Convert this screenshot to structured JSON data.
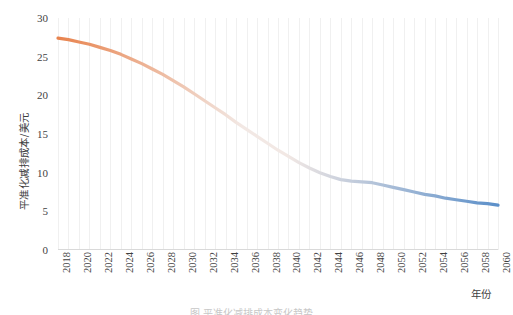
{
  "chart_data": {
    "type": "line",
    "title": "",
    "xlabel": "年份",
    "ylabel": "平准化减排成本/美元",
    "xlim": [
      2018,
      2060
    ],
    "ylim": [
      0,
      30
    ],
    "yticks": [
      0,
      5,
      10,
      15,
      20,
      25,
      30
    ],
    "xticks": [
      2018,
      2020,
      2022,
      2024,
      2026,
      2028,
      2030,
      2032,
      2034,
      2036,
      2038,
      2040,
      2042,
      2044,
      2046,
      2048,
      2050,
      2052,
      2054,
      2056,
      2058,
      2060
    ],
    "grid": "vertical-only",
    "legend": "none",
    "series": [
      {
        "name": "平准化减排成本",
        "gradient_start_color": "#E8834E",
        "gradient_mid_color": "#F2E8E4",
        "gradient_end_color": "#5B8FC9",
        "x": [
          2018,
          2019,
          2020,
          2021,
          2022,
          2023,
          2024,
          2025,
          2026,
          2027,
          2028,
          2029,
          2030,
          2031,
          2032,
          2033,
          2034,
          2035,
          2036,
          2037,
          2038,
          2039,
          2040,
          2041,
          2042,
          2043,
          2044,
          2045,
          2046,
          2047,
          2048,
          2049,
          2050,
          2051,
          2052,
          2053,
          2054,
          2055,
          2056,
          2057,
          2058,
          2059,
          2060
        ],
        "values": [
          27.4,
          27.2,
          26.9,
          26.6,
          26.2,
          25.8,
          25.3,
          24.7,
          24.1,
          23.4,
          22.7,
          21.9,
          21.1,
          20.2,
          19.3,
          18.4,
          17.5,
          16.5,
          15.6,
          14.7,
          13.8,
          12.9,
          12.1,
          11.3,
          10.6,
          10.0,
          9.5,
          9.1,
          8.9,
          8.8,
          8.7,
          8.4,
          8.1,
          7.8,
          7.5,
          7.2,
          7.0,
          6.7,
          6.5,
          6.3,
          6.1,
          6.0,
          5.8
        ]
      }
    ]
  },
  "axes": {
    "y_title": "平准化减排成本/美元",
    "x_title": "年份",
    "y_tick_labels": [
      "0",
      "5",
      "10",
      "15",
      "20",
      "25",
      "30"
    ],
    "x_tick_labels": [
      "2018",
      "2020",
      "2022",
      "2024",
      "2026",
      "2028",
      "2030",
      "2032",
      "2034",
      "2036",
      "2038",
      "2040",
      "2042",
      "2044",
      "2046",
      "2048",
      "2050",
      "2052",
      "2054",
      "2056",
      "2058",
      "2060"
    ]
  },
  "caption": {
    "text": "图 平准化减排成本变化趋势"
  },
  "colors": {
    "line_start": "#E8834E",
    "line_mid": "#F2E8E4",
    "line_end": "#5B8FC9",
    "gridline": "#F0F0F0",
    "axis": "#D9D9D9",
    "text": "#3F3F3F",
    "background": "#FFFFFF"
  }
}
